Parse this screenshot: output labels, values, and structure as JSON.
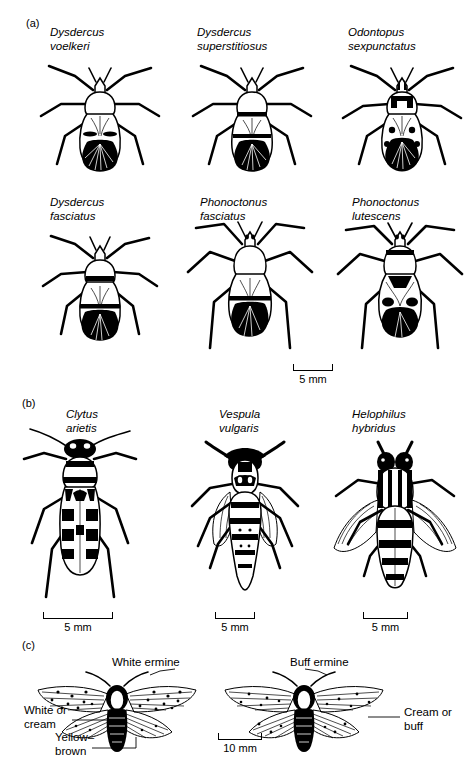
{
  "figure": {
    "caption_panels": [
      "(a)",
      "(b)",
      "(c)"
    ]
  },
  "panel_a": {
    "label": "(a)",
    "specimens": [
      {
        "genus": "Dysdercus",
        "species": "voelkeri",
        "type": "bug"
      },
      {
        "genus": "Dysdercus",
        "species": "superstitiosus",
        "type": "bug"
      },
      {
        "genus": "Odontopus",
        "species": "sexpunctatus",
        "type": "bug"
      },
      {
        "genus": "Dysdercus",
        "species": "fasciatus",
        "type": "bug"
      },
      {
        "genus": "Phonoctonus",
        "species": "fasciatus",
        "type": "assassin-bug"
      },
      {
        "genus": "Phonoctonus",
        "species": "lutescens",
        "type": "assassin-bug"
      }
    ],
    "scale": {
      "label": "5 mm"
    }
  },
  "panel_b": {
    "label": "(b)",
    "specimens": [
      {
        "genus": "Clytus",
        "species": "arietis",
        "type": "beetle"
      },
      {
        "genus": "Vespula",
        "species": "vulgaris",
        "type": "wasp"
      },
      {
        "genus": "Helophilus",
        "species": "hybridus",
        "type": "hoverfly"
      }
    ],
    "scales": [
      {
        "label": "5 mm"
      },
      {
        "label": "5 mm"
      },
      {
        "label": "5 mm"
      }
    ]
  },
  "panel_c": {
    "label": "(c)",
    "specimens": [
      {
        "name": "White ermine"
      },
      {
        "name": "Buff ermine"
      }
    ],
    "annotations": {
      "left_upper": "White or\ncream",
      "left_lower": "Yellow–\nbrown",
      "right": "Cream or\nbuff"
    },
    "scale": {
      "label": "10 mm"
    }
  },
  "colors": {
    "ink": "#000000",
    "paper": "#ffffff"
  }
}
